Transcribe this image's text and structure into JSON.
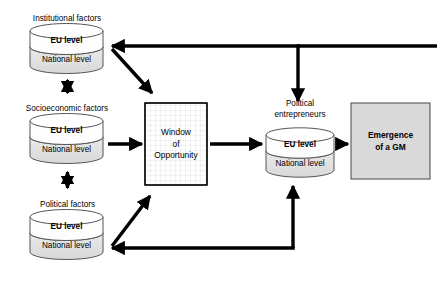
{
  "diagram": {
    "nodes": {
      "institutional": {
        "label": "Institutional factors",
        "eu": "EU level",
        "national": "National level"
      },
      "socioeconomic": {
        "label": "Socioeconomic factors",
        "eu": "EU level",
        "national": "National level"
      },
      "political_factors": {
        "label": "Political factors",
        "eu": "EU level",
        "national": "National level"
      },
      "political_entrepreneurs": {
        "label_line1": "Political",
        "label_line2": "entrepreneurs",
        "eu": "EU level",
        "national": "National level"
      },
      "window": {
        "line1": "Window",
        "line2": "of",
        "line3": "Opportunity"
      },
      "emergence": {
        "line1": "Emergence",
        "line2": "of a GM"
      }
    },
    "colors": {
      "stroke": "#000000",
      "cylinder_top_fill": "#ffffff",
      "cylinder_bottom_fill": "#e0e0e0",
      "emergence_fill": "#d9d9d9",
      "window_fill": "#ffffff",
      "grid_line": "#cccccc",
      "background": "#ffffff"
    }
  }
}
